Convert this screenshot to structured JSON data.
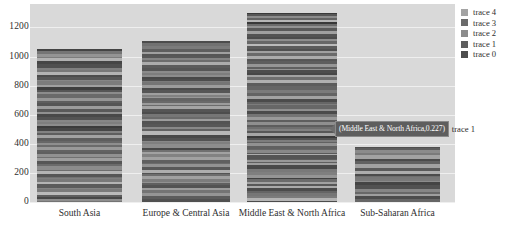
{
  "chart_data": {
    "type": "bar",
    "title": "",
    "xlabel": "",
    "ylabel": "",
    "stacked": true,
    "orientation": "vertical",
    "grid": true,
    "legend_position": "right",
    "ylim": [
      0,
      1320
    ],
    "yticks": [
      0,
      200,
      400,
      600,
      800,
      1000,
      1200
    ],
    "ytick_labels": [
      "0",
      "200",
      "400",
      "600",
      "800",
      "1000",
      "1200"
    ],
    "categories": [
      "South Asia",
      "Europe & Central Asia",
      "Middle East & North Africa",
      "Sub-Saharan Africa"
    ],
    "series": [
      {
        "name": "trace 0",
        "color": "#4d4d4d",
        "values": [
          211,
          222,
          260,
          76
        ]
      },
      {
        "name": "trace 1",
        "color": "#5e5e5e",
        "values": [
          211,
          222,
          260,
          76
        ]
      },
      {
        "name": "trace 2",
        "color": "#8c8c8c",
        "values": [
          211,
          222,
          260,
          76
        ]
      },
      {
        "name": "trace 3",
        "color": "#6b6b6b",
        "values": [
          211,
          222,
          260,
          76
        ]
      },
      {
        "name": "trace 4",
        "color": "#a3a3a3",
        "values": [
          211,
          222,
          260,
          76
        ]
      }
    ],
    "totals": [
      1055,
      1110,
      1300,
      380
    ],
    "annotations": [
      {
        "text": "(Middle East & North Africa,0.227)",
        "trace_label": "trace 1",
        "category": "Middle East & North Africa",
        "value": 0.227
      }
    ]
  },
  "legend": {
    "items": [
      {
        "label": "trace 4",
        "color": "#a3a3a3"
      },
      {
        "label": "trace 3",
        "color": "#6b6b6b"
      },
      {
        "label": "trace 2",
        "color": "#8c8c8c"
      },
      {
        "label": "trace 1",
        "color": "#5e5e5e"
      },
      {
        "label": "trace 0",
        "color": "#4d4d4d"
      }
    ]
  },
  "tooltip": {
    "text": "(Middle East & North Africa,0.227)",
    "trace_label": "trace 1"
  },
  "colors": {
    "plot_background": "#d9d9d9",
    "page_background": "#ffffff",
    "gridline": "#efefef",
    "tick_text": "#2e2e2e",
    "tooltip_background": "#5e5e5e",
    "tooltip_text": "#ffffff"
  }
}
